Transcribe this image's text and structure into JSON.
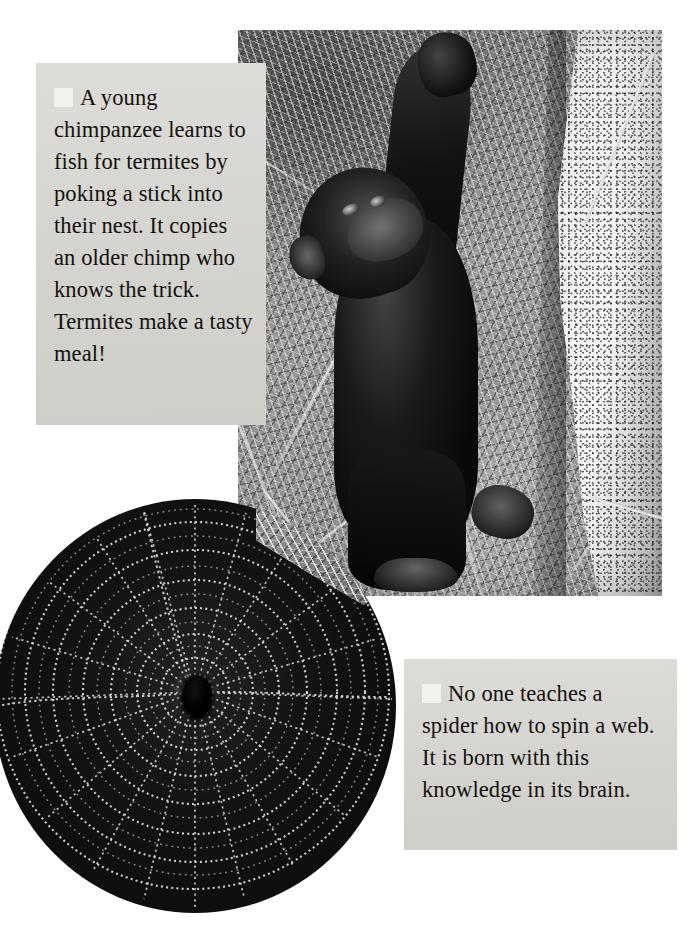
{
  "page": {
    "width": 700,
    "height": 931,
    "background_color": "#ffffff",
    "kind": "illustrated-book-page-spread",
    "rendering": "black-and-white photographs with grey caption panels"
  },
  "captions": [
    {
      "id": "chimp-caption",
      "bullet_icon": "white-square-bullet",
      "text": "A young chimpanzee learns to fish for termites by poking a stick into their nest. It copies an older chimp who knows the trick. Termites make a tasty meal!",
      "lines": [
        "A young",
        "chimpanzee",
        "learns to fish for",
        "termites by",
        "poking a stick",
        "into their nest.",
        "It copies an older",
        "chimp who",
        "knows the trick.",
        "Termites make a",
        "tasty meal!"
      ],
      "panel_color": "#d7d6d2",
      "text_color": "#121110"
    },
    {
      "id": "spider-caption",
      "bullet_icon": "white-square-bullet",
      "text": "No one teaches a spider how to spin a web. It is born with this knowledge in its brain.",
      "lines": [
        "No one teaches a",
        "spider how to spin",
        "a web. It is born",
        "with this knowledge",
        "in its brain."
      ],
      "panel_color": "#d7d6d2",
      "text_color": "#121110"
    }
  ],
  "photos": [
    {
      "id": "chimpanzee-photo",
      "subject": "young chimpanzee fishing for termites with a stick at a termite mound",
      "elements": [
        "chimpanzee",
        "thin stick held overhead",
        "second stick near mound base",
        "pale rough termite mound",
        "dry grass background"
      ],
      "color_mode": "black-and-white",
      "shape": "rectangle"
    },
    {
      "id": "spider-web-photo",
      "subject": "orb spider web covered in dew with a spider at the centre",
      "elements": [
        "spider at hub",
        "radial spokes",
        "beaded spiral threads",
        "dry grass in upper-right corner"
      ],
      "color_mode": "black-and-white",
      "shape": "circle"
    }
  ]
}
